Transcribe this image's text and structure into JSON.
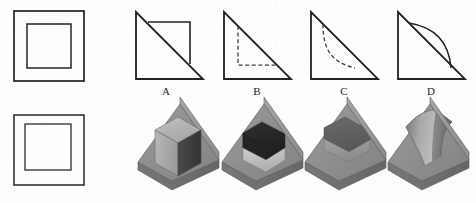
{
  "figure": {
    "background_color": "#fdfdfc",
    "line_color": "#222222",
    "dash_color": "#3a3a3a"
  },
  "orthographic_views": {
    "label": "Two square orthographic views (front view and top view)",
    "views": [
      {
        "name": "upper-square-view",
        "description": "Square with concentric inner square, outer square thicker",
        "outer": {
          "x": 14,
          "y": 11,
          "w": 70,
          "h": 70
        },
        "inner": {
          "x": 27,
          "y": 24,
          "w": 44,
          "h": 44
        },
        "outer_stroke": 1.7,
        "inner_stroke": 1.5
      },
      {
        "name": "lower-square-view",
        "description": "Square with concentric inner square, offset slightly upward-left",
        "outer": {
          "x": 14,
          "y": 115,
          "w": 70,
          "h": 70
        },
        "inner": {
          "x": 25,
          "y": 124,
          "w": 46,
          "h": 46
        },
        "outer_stroke": 1.5,
        "inner_stroke": 1.3
      }
    ]
  },
  "options": {
    "label": "Four candidate profile views labelled A through D",
    "items": [
      {
        "id": "A",
        "label": "A",
        "description": "Right triangle with a solid square outline in the upper right region",
        "triangle": {
          "apex": [
            136,
            12
          ],
          "bottom_left": [
            136,
            79
          ],
          "bottom_right": [
            203,
            79
          ]
        },
        "label_pos": [
          166,
          94
        ],
        "feature": "solid-square-overlay",
        "feature_rect": {
          "x": 155,
          "y": 22,
          "w": 35,
          "h": 38
        }
      },
      {
        "id": "B",
        "label": "B",
        "description": "Right triangle with dashed hidden square lines in lower left region",
        "triangle": {
          "apex": [
            224,
            12
          ],
          "bottom_left": [
            224,
            79
          ],
          "bottom_right": [
            291,
            79
          ]
        },
        "label_pos": [
          257,
          94
        ],
        "feature": "dashed-hidden-square",
        "feature_vertical_x": 243,
        "feature_vertical_y1": 24,
        "feature_vertical_y2": 65,
        "feature_horizontal_y": 65,
        "feature_horizontal_x2": 277
      },
      {
        "id": "C",
        "label": "C",
        "description": "Right triangle with a dashed concave curve from upper left down to the hypotenuse",
        "triangle": {
          "apex": [
            311,
            12
          ],
          "bottom_left": [
            311,
            79
          ],
          "bottom_right": [
            378,
            79
          ]
        },
        "label_pos": [
          344,
          94
        ],
        "feature": "dashed-concave-curve"
      },
      {
        "id": "D",
        "label": "D",
        "description": "Right triangle with a solid convex arc bulging above the hypotenuse",
        "triangle": {
          "apex": [
            398,
            12
          ],
          "bottom_left": [
            398,
            79
          ],
          "bottom_right": [
            465,
            79
          ]
        },
        "label_pos": [
          431,
          94
        ],
        "feature": "solid-convex-arc"
      }
    ]
  },
  "solids": {
    "label": "Four shaded isometric wedge solids",
    "palette": {
      "top_face": "#9a9a9a",
      "front_face": "#8e8e8e",
      "side_face": "#6f6f6f",
      "slope_face": "#878787",
      "recess_dark": "#3d3d3d",
      "recess_darker": "#2a2a2a",
      "recess_light": "#b4b4b4",
      "recess_mid": "#8a8a8a",
      "block_light": "#b0b0b0",
      "block_mid": "#a0a0a0",
      "outline": "#5a5a5a"
    },
    "items": [
      {
        "id": "solid-1",
        "name": "wedge-with-protruding-cube",
        "description": "Inclined wedge block with a rectangular cube protruding from the sloped face"
      },
      {
        "id": "solid-2",
        "name": "wedge-with-deep-rectangular-recess",
        "description": "Inclined wedge block with a deep rectangular recess cut into the sloped face"
      },
      {
        "id": "solid-3",
        "name": "wedge-with-shallow-rectangular-recess",
        "description": "Inclined wedge block with a shallow rectangular pocket in the sloped face"
      },
      {
        "id": "solid-4",
        "name": "wedge-with-curved-recess",
        "description": "Inclined wedge block with a curved (cylindrical) recess in the sloped face"
      }
    ]
  }
}
